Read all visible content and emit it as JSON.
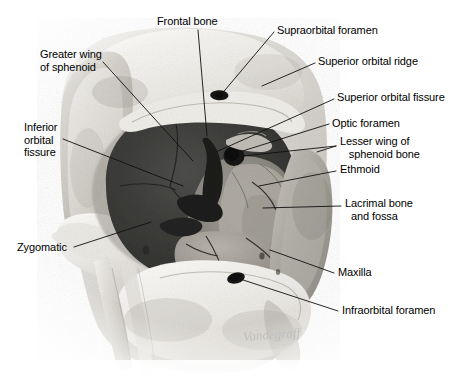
{
  "figure": {
    "background_color": "#ffffff",
    "line_color": "#101010",
    "text_color": "#000000",
    "orbit_cavity_color": "#3c3c3c",
    "bone_color": "#dcdcd8",
    "signature": "Vandegraff"
  },
  "labels": [
    {
      "id": "frontal-bone",
      "text": "Frontal bone",
      "x": 157,
      "y": 15,
      "align": "left"
    },
    {
      "id": "supraorbital-foramen",
      "text": "Supraorbital foramen",
      "x": 277,
      "y": 24,
      "align": "left"
    },
    {
      "id": "superior-orbital-ridge",
      "text": "Superior orbital ridge",
      "x": 318,
      "y": 55,
      "align": "left"
    },
    {
      "id": "superior-orbital-fissure",
      "text": "Superior orbital fissure",
      "x": 337,
      "y": 91,
      "align": "left"
    },
    {
      "id": "optic-foramen",
      "text": "Optic foramen",
      "x": 332,
      "y": 117,
      "align": "left"
    },
    {
      "id": "lesser-wing-of-sphenoid-bone",
      "text": "Lesser wing of\n   sphenoid bone",
      "x": 340,
      "y": 135,
      "align": "left"
    },
    {
      "id": "ethmoid",
      "text": "Ethmoid",
      "x": 340,
      "y": 163,
      "align": "left"
    },
    {
      "id": "lacrimal-bone-and-fossa",
      "text": "Lacrimal bone\n  and fossa",
      "x": 345,
      "y": 197,
      "align": "left"
    },
    {
      "id": "maxilla",
      "text": "Maxilla",
      "x": 338,
      "y": 266,
      "align": "left"
    },
    {
      "id": "infraorbital-foramen",
      "text": "Infraorbital foramen",
      "x": 342,
      "y": 304,
      "align": "left"
    },
    {
      "id": "greater-wing-of-sphenoid",
      "text": "Greater wing\nof sphenoid",
      "x": 40,
      "y": 48,
      "align": "left"
    },
    {
      "id": "inferior-orbital-fissure",
      "text": "Inferior\norbital\nfissure",
      "x": 24,
      "y": 121,
      "align": "left"
    },
    {
      "id": "zygomatic",
      "text": "Zygomatic",
      "x": 17,
      "y": 241,
      "align": "left"
    }
  ],
  "leader_lines": [
    {
      "id": "leader-frontal-bone",
      "points": "198,30 207,136"
    },
    {
      "id": "leader-supraorbital-foramen",
      "points": "274,32 220,96"
    },
    {
      "id": "leader-superior-orbital-ridge",
      "points": "315,63 262,86"
    },
    {
      "id": "leader-superior-orbital-fissure",
      "points": "334,99 216,152"
    },
    {
      "id": "leader-optic-foramen",
      "points": "329,124 233,154"
    },
    {
      "id": "leader-lesser-wing",
      "points": "336,146 317,152"
    },
    {
      "id": "leader-lesser-wing-2",
      "points": "336,146 243,156"
    },
    {
      "id": "leader-ethmoid",
      "points": "336,171 259,186"
    },
    {
      "id": "leader-lacrimal",
      "points": "341,206 263,208"
    },
    {
      "id": "leader-maxilla",
      "points": "334,273 270,250"
    },
    {
      "id": "leader-infraorbital-foramen",
      "points": "338,311 234,277"
    },
    {
      "id": "leader-greater-wing",
      "points": "103,62 193,161"
    },
    {
      "id": "leader-inferior-orbital-fissure",
      "points": "63,139 183,186"
    },
    {
      "id": "leader-zygomatic",
      "points": "74,247 151,222"
    }
  ]
}
